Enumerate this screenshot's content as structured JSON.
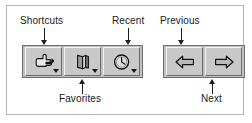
{
  "figure": {
    "background_color": "#ffffff",
    "frame_border_color": "#b7b7b7"
  },
  "callouts": [
    {
      "id": "shortcuts",
      "label": "Shortcuts",
      "direction": "down",
      "target": "shortcuts-button"
    },
    {
      "id": "recent",
      "label": "Recent",
      "direction": "down",
      "target": "recent-button"
    },
    {
      "id": "previous",
      "label": "Previous",
      "direction": "down",
      "target": "previous-button"
    },
    {
      "id": "favorites",
      "label": "Favorites",
      "direction": "up",
      "target": "favorites-button"
    },
    {
      "id": "next",
      "label": "Next",
      "direction": "up",
      "target": "next-button"
    }
  ],
  "toolbar": {
    "face_color": "#c8c8c8",
    "group_color": "#c0c0c0",
    "border_color": "#6e6e6e",
    "dropdown_group": {
      "name": "dropdown-button-group",
      "buttons": [
        {
          "id": "shortcuts",
          "icon": "pointing-hand-icon",
          "tooltip": "Shortcuts",
          "has_dropdown": true
        },
        {
          "id": "favorites",
          "icon": "book-icon",
          "tooltip": "Favorites",
          "has_dropdown": true
        },
        {
          "id": "recent",
          "icon": "clock-icon",
          "tooltip": "Recent",
          "has_dropdown": true
        }
      ]
    },
    "nav_group": {
      "name": "navigation-button-group",
      "buttons": [
        {
          "id": "previous",
          "icon": "arrow-left-icon",
          "tooltip": "Previous",
          "has_dropdown": false
        },
        {
          "id": "next",
          "icon": "arrow-right-icon",
          "tooltip": "Next",
          "has_dropdown": false
        }
      ]
    }
  }
}
